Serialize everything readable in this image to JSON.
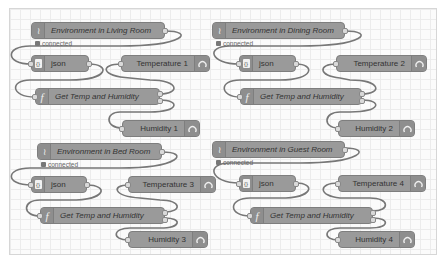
{
  "groups": [
    {
      "inject": {
        "label": "Environment in Living Room",
        "status": "connected"
      },
      "json": {
        "label": "json"
      },
      "function": {
        "label": "Get Temp and Humidity"
      },
      "temperature": {
        "label": "Temperature 1"
      },
      "humidity": {
        "label": "Humidity 1"
      }
    },
    {
      "inject": {
        "label": "Environment in Dining Room",
        "status": "connected"
      },
      "json": {
        "label": "json"
      },
      "function": {
        "label": "Get Temp and Humidity"
      },
      "temperature": {
        "label": "Temperature 2"
      },
      "humidity": {
        "label": "Humidity 2"
      }
    },
    {
      "inject": {
        "label": "Environment in Bed Room",
        "status": "connected"
      },
      "json": {
        "label": "json"
      },
      "function": {
        "label": "Get Temp and Humidity"
      },
      "temperature": {
        "label": "Temperature 3"
      },
      "humidity": {
        "label": "Humidity 3"
      }
    },
    {
      "inject": {
        "label": "Environment in Guest Room",
        "status": "connected"
      },
      "json": {
        "label": "json"
      },
      "function": {
        "label": "Get Temp and Humidity"
      },
      "temperature": {
        "label": "Temperature 4"
      },
      "humidity": {
        "label": "Humidity 4"
      }
    }
  ],
  "icons": {
    "input": "wifi-wave-icon",
    "json": "braces-icon",
    "function": "function-f-icon",
    "gauge": "gauge-icon"
  }
}
